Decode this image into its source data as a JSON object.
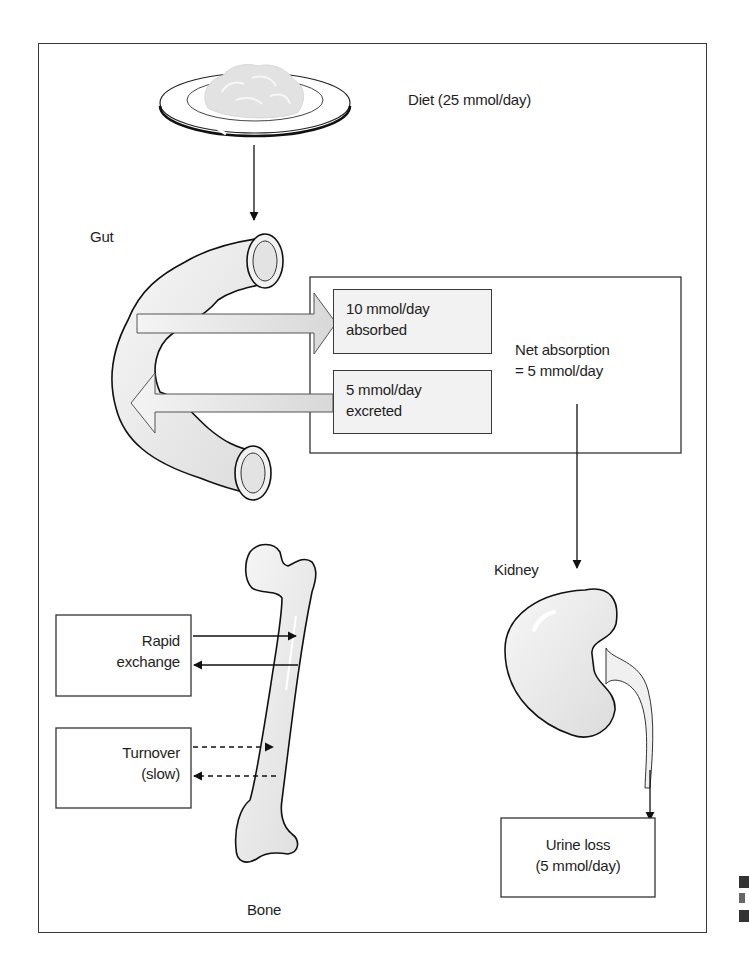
{
  "diagram": {
    "diet": {
      "label": "Diet (25 mmol/day)"
    },
    "gut": {
      "label": "Gut",
      "absorbed": {
        "line1": "10 mmol/day",
        "line2": "absorbed"
      },
      "excreted": {
        "line1": "5 mmol/day",
        "line2": "excreted"
      },
      "net": {
        "line1": "Net absorption",
        "line2": "= 5 mmol/day"
      }
    },
    "kidney": {
      "label": "Kidney"
    },
    "urine": {
      "line1": "Urine loss",
      "line2": "(5 mmol/day)"
    },
    "bone": {
      "label": "Bone",
      "rapid": {
        "line1": "Rapid",
        "line2": "exchange"
      },
      "turnover": {
        "line1": "Turnover",
        "line2": "(slow)"
      }
    },
    "flows": [
      {
        "from": "diet",
        "to": "gut",
        "style": "solid"
      },
      {
        "from": "gut",
        "to": "absorbed",
        "value": "10 mmol/day",
        "style": "block"
      },
      {
        "from": "excreted",
        "to": "gut",
        "value": "5 mmol/day",
        "style": "block"
      },
      {
        "from": "net-absorption",
        "to": "kidney",
        "style": "solid"
      },
      {
        "from": "kidney",
        "to": "urine",
        "value": "5 mmol/day",
        "style": "solid"
      },
      {
        "from": "rapid-exchange",
        "to": "bone",
        "style": "solid"
      },
      {
        "from": "bone",
        "to": "rapid-exchange",
        "style": "solid"
      },
      {
        "from": "turnover",
        "to": "bone",
        "style": "dashed"
      },
      {
        "from": "bone",
        "to": "turnover",
        "style": "dashed"
      }
    ]
  }
}
